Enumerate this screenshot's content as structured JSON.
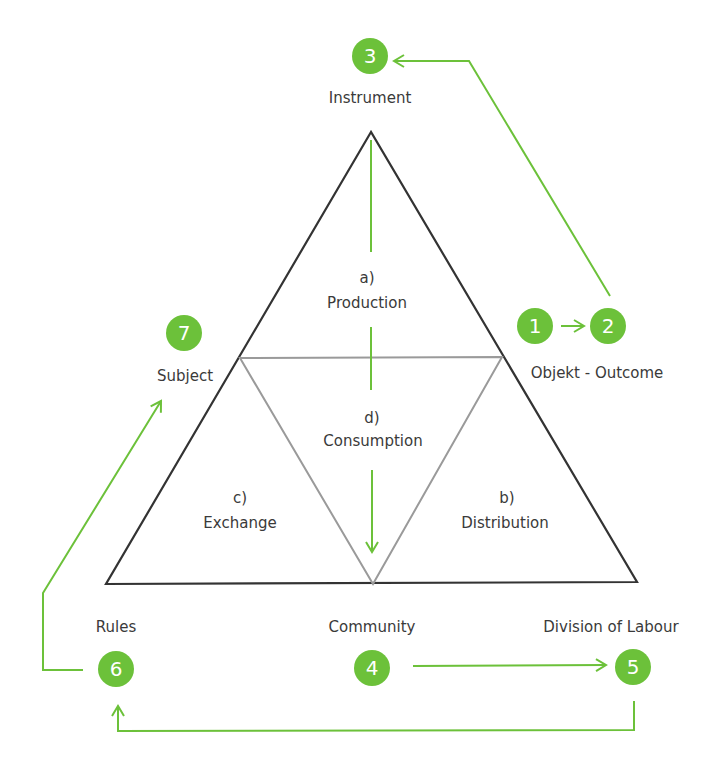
{
  "colors": {
    "accent": "#6cc13a",
    "outer_triangle": "#333333",
    "inner_triangle": "#9a9a9a",
    "text": "#3a3a3a"
  },
  "nodes": [
    {
      "number": "3",
      "label": "Instrument"
    },
    {
      "number": "1",
      "label": ""
    },
    {
      "number": "2",
      "label": "Objekt - Outcome"
    },
    {
      "number": "7",
      "label": "Subject"
    },
    {
      "number": "6",
      "label": "Rules"
    },
    {
      "number": "4",
      "label": "Community"
    },
    {
      "number": "5",
      "label": "Division of Labour"
    }
  ],
  "sections": [
    {
      "letter": "a)",
      "label": "Production"
    },
    {
      "letter": "b)",
      "label": "Distribution"
    },
    {
      "letter": "c)",
      "label": "Exchange"
    },
    {
      "letter": "d)",
      "label": "Consumption"
    }
  ]
}
